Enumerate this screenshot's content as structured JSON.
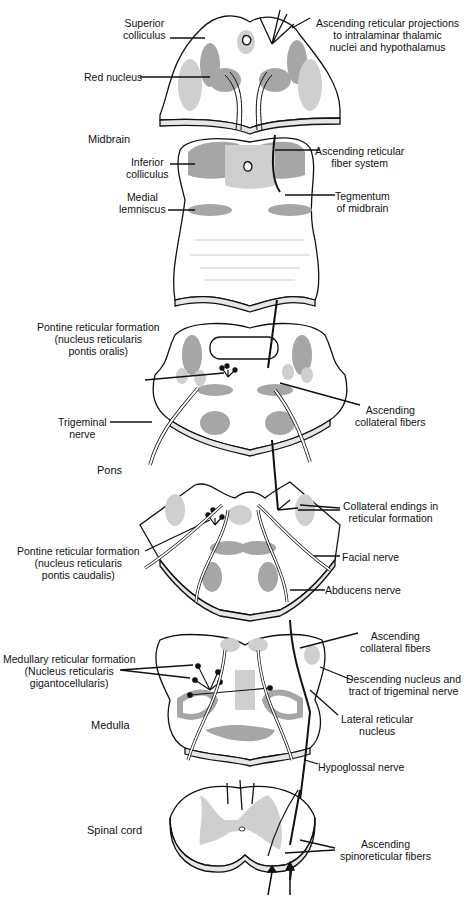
{
  "diagram": {
    "type": "anatomical-cross-sections",
    "colors": {
      "dark_gray": "#a6a6a6",
      "light_gray": "#cfcfcf",
      "outline": "#111111",
      "rim": "#e6e6e6"
    },
    "sections": [
      {
        "name": "Midbrain",
        "label": "Midbrain"
      },
      {
        "name": "Pons",
        "label": "Pons"
      },
      {
        "name": "Medulla",
        "label": "Medulla"
      },
      {
        "name": "Spinal cord",
        "label": "Spinal cord"
      }
    ],
    "labels": {
      "superior_colliculus": [
        "Superior",
        "colliculus"
      ],
      "red_nucleus": "Red nucleus",
      "ascending_reticular_projections": [
        "Ascending reticular projections",
        "to intralaminar thalamic",
        "nuclei and hypothalamus"
      ],
      "inferior_colliculus": [
        "Inferior",
        "colliculus"
      ],
      "medial_lemniscus": [
        "Medial",
        "lemniscus"
      ],
      "ascending_reticular_fiber_system": [
        "Ascending reticular",
        "fiber system"
      ],
      "tegmentum_midbrain": [
        "Tegmentum",
        "of midbrain"
      ],
      "pontine_rf_oralis": [
        "Pontine reticular formation",
        "(nucleus reticularis",
        "pontis oralis)"
      ],
      "trigeminal_nerve": [
        "Trigeminal",
        "nerve"
      ],
      "ascending_collateral_fibers_pons": [
        "Ascending",
        "collateral fibers"
      ],
      "collateral_endings": [
        "Collateral endings in",
        "reticular formation"
      ],
      "pontine_rf_caudalis": [
        "Pontine reticular formation",
        "(nucleus reticularis",
        "pontis caudalis)"
      ],
      "facial_nerve": "Facial nerve",
      "abducens_nerve": "Abducens nerve",
      "medullary_rf": [
        "Medullary reticular formation",
        "(Nucleus reticularis",
        "gigantocellularis)"
      ],
      "ascending_collateral_fibers_medulla": [
        "Ascending",
        "collateral fibers"
      ],
      "descending_nucleus_trigeminal": [
        "Descending nucleus and",
        "tract of trigeminal nerve"
      ],
      "lateral_reticular_nucleus": [
        "Lateral reticular",
        "nucleus"
      ],
      "hypoglossal_nerve": "Hypoglossal nerve",
      "ascending_spinoreticular": [
        "Ascending",
        "spinoreticular fibers"
      ]
    }
  }
}
